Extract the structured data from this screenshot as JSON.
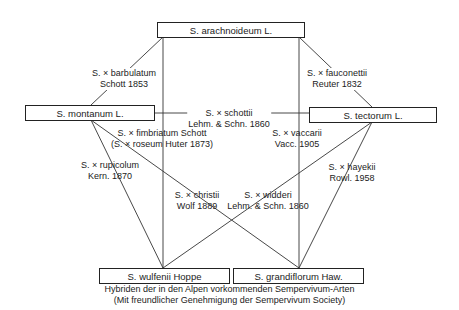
{
  "species": {
    "arachnoideum": "S. arachnoideum L.",
    "montanum": "S. montanum L.",
    "tectorum": "S. tectorum L.",
    "wulfenii": "S. wulfenii Hoppe",
    "grandiflorum": "S. grandiflorum Haw."
  },
  "hybrids": [
    {
      "id": "barbulatum",
      "name": "S. × barbulatum",
      "author": "Schott 1853",
      "parents": [
        "arachnoideum",
        "montanum"
      ]
    },
    {
      "id": "fauconettii",
      "name": "S. × fauconettii",
      "author": "Reuter 1832",
      "parents": [
        "arachnoideum",
        "tectorum"
      ]
    },
    {
      "id": "schottii",
      "name": "S. × schottii",
      "author": "Lehm. & Schn. 1860",
      "parents": [
        "montanum",
        "tectorum"
      ]
    },
    {
      "id": "fimbriatum",
      "name": "S. × fimbriatum Schott",
      "author": "(S. × roseum Huter 1873)",
      "parents": [
        "arachnoideum",
        "tectorum"
      ]
    },
    {
      "id": "vaccarii",
      "name": "S. × vaccarii",
      "author": "Vacc. 1905",
      "parents": [
        "arachnoideum",
        "grandiflorum"
      ]
    },
    {
      "id": "rupicolum",
      "name": "S. × rupicolum",
      "author": "Kern. 1870",
      "parents": [
        "montanum",
        "wulfenii"
      ]
    },
    {
      "id": "hayekii",
      "name": "S. × hayekii",
      "author": "Rowl. 1958",
      "parents": [
        "tectorum",
        "grandiflorum"
      ]
    },
    {
      "id": "christii",
      "name": "S. × christii",
      "author": "Wolf 1889",
      "parents": [
        "montanum",
        "grandiflorum"
      ]
    },
    {
      "id": "widderi",
      "name": "S. × widderi",
      "author": "Lehm. & Schn. 1860",
      "parents": [
        "tectorum",
        "wulfenii"
      ]
    }
  ],
  "caption": {
    "line1": "Hybriden der in den Alpen vorkommenden Sempervivum-Arten",
    "line2": "(Mit freundlicher Genehmigung der Sempervivum Society)"
  }
}
